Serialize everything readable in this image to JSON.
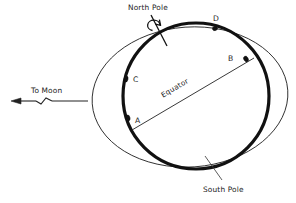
{
  "diagram": {
    "labels": {
      "north_pole": "North Pole",
      "south_pole": "South Pole",
      "equator": "Equator",
      "to_moon": "To Moon"
    },
    "points": [
      {
        "id": "A",
        "label": "A",
        "x": 129,
        "y": 119,
        "label_x": 136,
        "label_y": 122
      },
      {
        "id": "B",
        "label": "B",
        "x": 244,
        "y": 60,
        "label_x": 231,
        "label_y": 60
      },
      {
        "id": "C",
        "label": "C",
        "x": 127,
        "y": 80,
        "label_x": 135,
        "label_y": 82
      },
      {
        "id": "D",
        "label": "D",
        "x": 215,
        "y": 29,
        "label_x": 215,
        "label_y": 22
      }
    ],
    "shapes": {
      "earth_circle": {
        "cx": 196,
        "cy": 96,
        "r": 73,
        "stroke": "#111111",
        "stroke_width": 3.2
      },
      "tidal_bulge_ellipse": {
        "cx": 190,
        "cy": 97,
        "rx": 98,
        "ry": 70,
        "rotation_deg": -4,
        "stroke": "#222222",
        "stroke_width": 0.9
      },
      "equator_line": {
        "x1": 132,
        "y1": 130,
        "x2": 254,
        "y2": 58
      },
      "rotation_axis": {
        "x1": 152,
        "y1": 16,
        "x2": 166,
        "y2": 44
      },
      "south_pole_leader": {
        "x1": 222,
        "y1": 180,
        "x2": 206,
        "y2": 157
      },
      "moon_arrow": {
        "x1": 88,
        "y1": 101,
        "x2": 12,
        "y2": 101,
        "head": "left",
        "break_symbol": "zigzag"
      }
    },
    "colors": {
      "background": "#ffffff",
      "ink": "#111111",
      "thin_ink": "#222222"
    }
  }
}
